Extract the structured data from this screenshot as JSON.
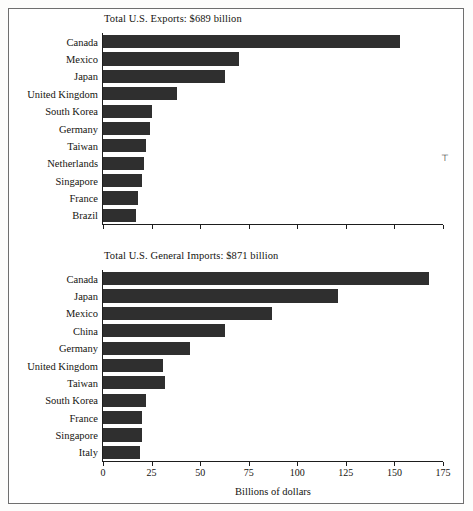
{
  "figure": {
    "background_color": "#ffffff",
    "frame_color": "#6f6f6f",
    "bar_color": "#2f2f2f",
    "artifact_mark": "⊤"
  },
  "axis": {
    "title": "Billions of dollars",
    "ticks": [
      "0",
      "25",
      "50",
      "75",
      "100",
      "125",
      "150",
      "175"
    ]
  },
  "chart_data": [
    {
      "type": "bar",
      "orientation": "horizontal",
      "title": "Total U.S. Exports: $689 billion",
      "xlabel": "Billions of dollars",
      "ylabel": "",
      "xlim": [
        0,
        175
      ],
      "xticks": [
        0,
        25,
        50,
        75,
        100,
        125,
        150,
        175
      ],
      "tick_labels_shown": false,
      "grid": false,
      "legend": null,
      "categories": [
        "Canada",
        "Mexico",
        "Japan",
        "United Kingdom",
        "South Korea",
        "Germany",
        "Taiwan",
        "Netherlands",
        "Singapore",
        "France",
        "Brazil"
      ],
      "values": [
        153,
        70,
        63,
        38,
        25,
        24,
        22,
        21,
        20,
        18,
        17
      ]
    },
    {
      "type": "bar",
      "orientation": "horizontal",
      "title": "Total U.S. General Imports: $871 billion",
      "xlabel": "Billions of dollars",
      "ylabel": "",
      "xlim": [
        0,
        175
      ],
      "xticks": [
        0,
        25,
        50,
        75,
        100,
        125,
        150,
        175
      ],
      "tick_labels_shown": true,
      "grid": false,
      "legend": null,
      "categories": [
        "Canada",
        "Japan",
        "Mexico",
        "China",
        "Germany",
        "United Kingdom",
        "Taiwan",
        "South Korea",
        "France",
        "Singapore",
        "Italy"
      ],
      "values": [
        168,
        121,
        87,
        63,
        45,
        31,
        32,
        22,
        20,
        20,
        19
      ]
    }
  ]
}
